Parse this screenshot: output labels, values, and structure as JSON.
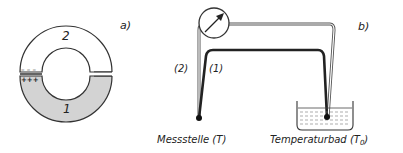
{
  "panel_a": {
    "tag": "a)",
    "region_top_label": "2",
    "region_bottom_label": "1",
    "charge_negative": "– – –",
    "charge_positive": "+++",
    "colors": {
      "region_1_fill": "#d3d3d3",
      "line": "#333333"
    }
  },
  "panel_b": {
    "tag": "b)",
    "wire_2_label": "(2)",
    "wire_1_label": "(1)",
    "junction_left_label": "Messstelle (T)",
    "junction_right_label_main": "Temperaturbad (T",
    "junction_right_label_sub": "0",
    "junction_right_label_end": ")",
    "instrument": "voltmeter-gauge",
    "colors": {
      "wire_1": "#222222",
      "wire_2": "#555555"
    }
  }
}
